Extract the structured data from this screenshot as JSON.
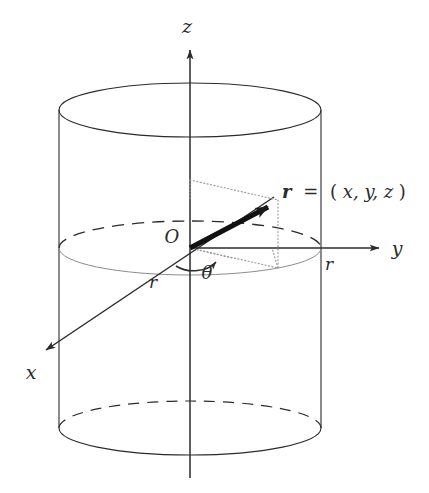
{
  "figure": {
    "kind": "cylindrical-coordinate-diagram",
    "background_color": "#ffffff",
    "stroke_color": "#2b2b2b",
    "light_stroke_color": "#8a8a8a",
    "dotted_color": "#9a9a9a",
    "labels": {
      "z_axis": "z",
      "y_axis": "y",
      "x_axis": "x",
      "origin": "O",
      "theta": "θ",
      "radius_x_side": "r",
      "radius_y_side": "r",
      "vector_symbol": "r",
      "vector_equals": "=",
      "vector_open_paren": "(",
      "vector_components": "x, y, z",
      "vector_close_paren": ")",
      "vector_full": "r = (x, y, z)"
    },
    "geometry": {
      "cylinder_center_x": 190,
      "cylinder_radius_x": 131,
      "ellipse_radius_y": 27,
      "top_ellipse_cy": 110,
      "mid_ellipse_cy": 248,
      "bottom_ellipse_cy": 428,
      "origin": [
        190,
        248
      ],
      "vector_tip": [
        278,
        200
      ],
      "projection_point": [
        278,
        268
      ],
      "z_axis_top": [
        190,
        42
      ],
      "z_axis_bottom": [
        190,
        478
      ],
      "y_axis_tip": [
        388,
        248
      ],
      "x_axis_tip": [
        38,
        356
      ]
    }
  }
}
